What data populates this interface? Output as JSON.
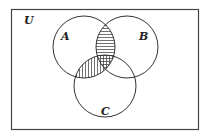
{
  "diagram": {
    "type": "venn",
    "universe_label": "U",
    "sets": [
      {
        "label": "A",
        "cx": 84,
        "cy": 47,
        "r": 31
      },
      {
        "label": "B",
        "cx": 127,
        "cy": 47,
        "r": 31
      },
      {
        "label": "C",
        "cx": 105,
        "cy": 86,
        "r": 31
      }
    ],
    "shaded_regions": [
      {
        "region": "A∩B∩C'",
        "pattern": "horizontal"
      },
      {
        "region": "A∩C∩B'",
        "pattern": "vertical"
      },
      {
        "region": "A∩B∩C",
        "pattern": "crosshatch"
      }
    ],
    "colors": {
      "stroke": "#333333",
      "background": "#ffffff"
    }
  }
}
